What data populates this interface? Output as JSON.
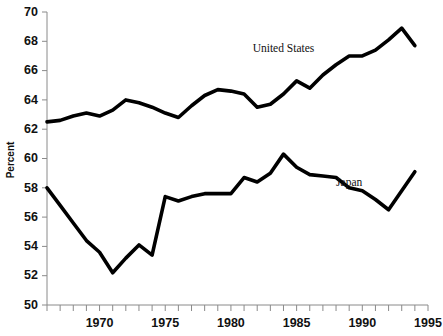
{
  "chart_data": {
    "type": "line",
    "title": "",
    "xlabel": "",
    "ylabel": "Percent",
    "ylim": [
      50,
      70
    ],
    "xlim": [
      1966,
      1995
    ],
    "yticks": [
      50,
      52,
      54,
      56,
      58,
      60,
      62,
      64,
      66,
      68,
      70
    ],
    "xticks": [
      1966,
      1967,
      1968,
      1969,
      1970,
      1971,
      1972,
      1973,
      1974,
      1975,
      1976,
      1977,
      1978,
      1979,
      1980,
      1981,
      1982,
      1983,
      1984,
      1985,
      1986,
      1987,
      1988,
      1989,
      1990,
      1991,
      1992,
      1993,
      1994,
      1995
    ],
    "xtick_labels": [
      "1970",
      "1975",
      "1980",
      "1985",
      "1990",
      "1995"
    ],
    "xtick_label_values": [
      1970,
      1975,
      1980,
      1985,
      1990,
      1995
    ],
    "grid": false,
    "legend_position": "inline-annotation",
    "x": [
      1966,
      1967,
      1968,
      1969,
      1970,
      1971,
      1972,
      1973,
      1974,
      1975,
      1976,
      1977,
      1978,
      1979,
      1980,
      1981,
      1982,
      1983,
      1984,
      1985,
      1986,
      1987,
      1988,
      1989,
      1990,
      1991,
      1992,
      1993,
      1994
    ],
    "series": [
      {
        "name": "United States",
        "color": "#000000",
        "values": [
          62.5,
          62.6,
          62.9,
          63.1,
          62.9,
          63.3,
          64.0,
          63.8,
          63.5,
          63.1,
          62.8,
          63.6,
          64.3,
          64.7,
          64.6,
          64.4,
          63.5,
          63.7,
          64.4,
          65.3,
          64.8,
          65.7,
          66.4,
          67.0,
          67.0,
          67.4,
          68.1,
          68.9,
          67.7
        ],
        "label_x": 1984,
        "label_y": 67.3
      },
      {
        "name": "Japan",
        "color": "#000000",
        "values": [
          58.0,
          56.8,
          55.6,
          54.4,
          53.6,
          52.2,
          53.2,
          54.1,
          53.4,
          57.4,
          57.1,
          57.4,
          57.6,
          57.6,
          57.6,
          58.7,
          58.4,
          59.0,
          60.3,
          59.4,
          58.9,
          58.8,
          58.7,
          58.0,
          57.8,
          57.2,
          56.5,
          57.8,
          59.1
        ],
        "label_x": 1989,
        "label_y": 58.1
      }
    ]
  }
}
